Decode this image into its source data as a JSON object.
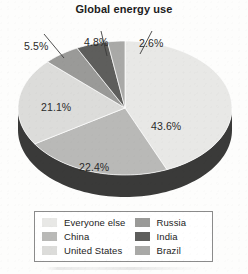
{
  "chart_data": {
    "type": "pie",
    "title": "Global energy use",
    "xlabel": "",
    "ylabel": "",
    "legend_position": "bottom",
    "grid": false,
    "three_d": true,
    "units": "percent",
    "categories": [
      "Everyone else",
      "China",
      "United States",
      "Russia",
      "India",
      "Brazil"
    ],
    "values": [
      43.6,
      22.4,
      21.1,
      5.5,
      4.8,
      2.6
    ],
    "slices": [
      {
        "label": "Everyone else",
        "value": 43.6,
        "display": "43.6%",
        "color": "#e8e8e6"
      },
      {
        "label": "China",
        "value": 22.4,
        "display": "22.4%",
        "color": "#b9b9b7"
      },
      {
        "label": "United States",
        "value": 21.1,
        "display": "21.1%",
        "color": "#dcdcda"
      },
      {
        "label": "Russia",
        "value": 5.5,
        "display": "5.5%",
        "color": "#9a9a98"
      },
      {
        "label": "India",
        "value": 4.8,
        "display": "4.8%",
        "color": "#5e5e5c"
      },
      {
        "label": "Brazil",
        "value": 2.6,
        "display": "2.6%",
        "color": "#a9a9a7"
      }
    ],
    "slice_labels": {
      "everyone_else": "43.6%",
      "china": "22.4%",
      "united_states": "21.1%",
      "russia": "5.5%",
      "india": "4.8%",
      "brazil": "2.6%"
    },
    "depth_color": "#3a3a39"
  },
  "legend": {
    "columns": [
      {
        "items": [
          {
            "label": "Everyone else",
            "color": "#e8e8e6"
          },
          {
            "label": "China",
            "color": "#b9b9b7"
          },
          {
            "label": "United States",
            "color": "#dcdcda"
          }
        ]
      },
      {
        "items": [
          {
            "label": "Russia",
            "color": "#9a9a98"
          },
          {
            "label": "India",
            "color": "#5e5e5c"
          },
          {
            "label": "Brazil",
            "color": "#a9a9a7"
          }
        ]
      }
    ]
  }
}
